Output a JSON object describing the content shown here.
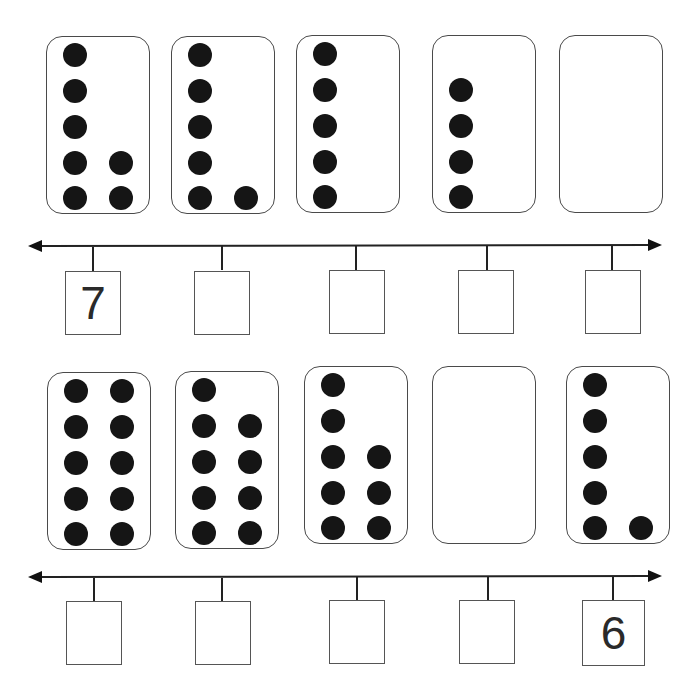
{
  "worksheet": {
    "rows": [
      {
        "cards": [
          {
            "count": 7,
            "col1": 5,
            "col2": 2
          },
          {
            "count": 6,
            "col1": 5,
            "col2": 1
          },
          {
            "count": 5,
            "col1": 5,
            "col2": 0
          },
          {
            "count": 4,
            "col1": 4,
            "col2": 0
          },
          {
            "count": 0,
            "col1": 0,
            "col2": 0
          }
        ],
        "boxes": [
          "7",
          "",
          "",
          "",
          ""
        ]
      },
      {
        "cards": [
          {
            "count": 10,
            "col1": 5,
            "col2": 5
          },
          {
            "count": 9,
            "col1": 5,
            "col2": 4
          },
          {
            "count": 8,
            "col1": 5,
            "col2": 3
          },
          {
            "count": 0,
            "col1": 0,
            "col2": 0
          },
          {
            "count": 6,
            "col1": 5,
            "col2": 1
          }
        ],
        "boxes": [
          "",
          "",
          "",
          "",
          "6"
        ]
      }
    ]
  }
}
